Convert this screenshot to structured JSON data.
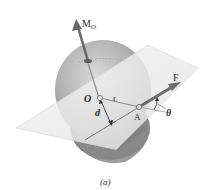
{
  "figure": {
    "caption": "(a)"
  },
  "labels": {
    "moment_main": "M",
    "moment_sub": "O",
    "origin": "O",
    "position_vector": "r",
    "distance": "d",
    "point": "A",
    "force": "F",
    "angle": "θ"
  },
  "colors": {
    "sphere_light": "#d8d8d8",
    "sphere_dark": "#8a8a8a",
    "plane": "#eeeeee",
    "plane_edge": "#c8c8c8",
    "arrow": "#6e6e6e",
    "text": "#2a2a2a"
  }
}
